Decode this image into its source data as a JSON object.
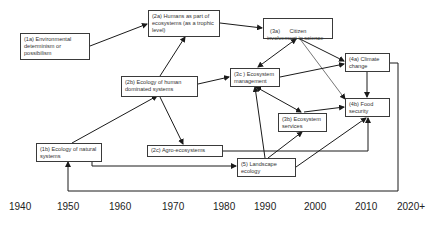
{
  "nodes": {
    "n1a": {
      "label": "(1a) Environmental determinism or possibilism"
    },
    "n2a": {
      "label": "(2a) Humans as part of ecosystems (as a trophic level)"
    },
    "n3a": {
      "label": "(3a)      Citizen involvement in science"
    },
    "n2b": {
      "label": "(2b) Ecology of human dominated systems"
    },
    "n3c": {
      "label": "(3c ) Ecosystem management"
    },
    "n4a": {
      "label": "(4a) Climate change"
    },
    "n4b": {
      "label": "(4b) Food security"
    },
    "n3b": {
      "label": "(3b) Ecosystem services"
    },
    "n1b": {
      "label": "(1b) Ecology of natural systems"
    },
    "n2c": {
      "label": "(2c) Agro-ecosystems"
    },
    "n5": {
      "label": "(5) Landscape ecology"
    }
  },
  "timeline": {
    "years": [
      "1940",
      "1950",
      "1960",
      "1970",
      "1980",
      "1990",
      "2000",
      "2010",
      "2020+"
    ]
  },
  "edges": [
    {
      "from": "1a",
      "to": "2a"
    },
    {
      "from": "1b",
      "to": "2b"
    },
    {
      "from": "2b",
      "to": "2a"
    },
    {
      "from": "2b",
      "to": "3c"
    },
    {
      "from": "2b",
      "to": "2c"
    },
    {
      "from": "2a",
      "to": "3a"
    },
    {
      "from": "3a",
      "to": "3c",
      "bidirectional": true
    },
    {
      "from": "3a",
      "to": "4a"
    },
    {
      "from": "3a",
      "to": "4b"
    },
    {
      "from": "3c",
      "to": "4a"
    },
    {
      "from": "3c",
      "to": "3b",
      "bidirectional": true
    },
    {
      "from": "4a",
      "to": "4b"
    },
    {
      "from": "3b",
      "to": "4b"
    },
    {
      "from": "5",
      "to": "3c"
    },
    {
      "from": "5",
      "to": "3b"
    },
    {
      "from": "5",
      "to": "4b"
    },
    {
      "from": "2c",
      "to": "4b"
    },
    {
      "from": "1b",
      "to": "5"
    },
    {
      "from": "4a",
      "to": "1b"
    }
  ],
  "colors": {
    "line": "#1a1a1a",
    "box_border": "#3a3a3a",
    "text": "#333333"
  }
}
